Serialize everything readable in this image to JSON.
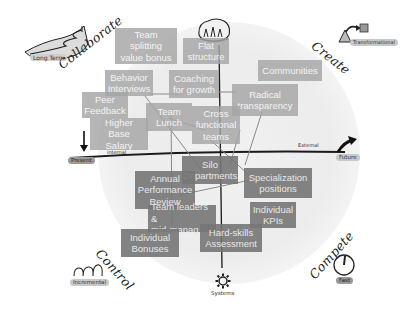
{
  "diagram": {
    "quadrants": {
      "top_left": "Collaborate",
      "top_right": "Create",
      "bottom_left": "Control",
      "bottom_right": "Compete"
    },
    "corner_tags": {
      "top_left": "Long Term",
      "top_right": "Transformational",
      "bottom_left": "Incremental",
      "bottom_right": "Fast"
    },
    "axis_labels": {
      "left": "Present",
      "right": "Future",
      "bottom": "Systems",
      "horizontal_right_note": "External",
      "horizontal_left_note": "internal"
    },
    "colors": {
      "light_box": "#a5a5a5",
      "dark_box": "#767676",
      "axis": "#1a1a1a",
      "halo": "#ececec"
    },
    "boxes_upper": [
      {
        "label": "Team splitting\nvalue bonus"
      },
      {
        "label": "Flat\nstructure"
      },
      {
        "label": "Communities"
      },
      {
        "label": "Behavior\nInterviews"
      },
      {
        "label": "Coaching\nfor growth"
      },
      {
        "label": "Radical\ntransparency"
      },
      {
        "label": "Peer\nFeedback"
      },
      {
        "label": "Team\nLunch"
      },
      {
        "label": "Cross\nfunctional\nteams"
      },
      {
        "label": "Higher Base\nSalary"
      }
    ],
    "boxes_lower": [
      {
        "label": "Silo\nDepartments"
      },
      {
        "label": "Specialization\npositions"
      },
      {
        "label": "Annual\nPerformance\nReview"
      },
      {
        "label": "Team leaders &\nmid-manag"
      },
      {
        "label": "Individual\nKPIs"
      },
      {
        "label": "Hard-skills\nAssessment"
      },
      {
        "label": "Individual\nBonuses"
      }
    ]
  }
}
